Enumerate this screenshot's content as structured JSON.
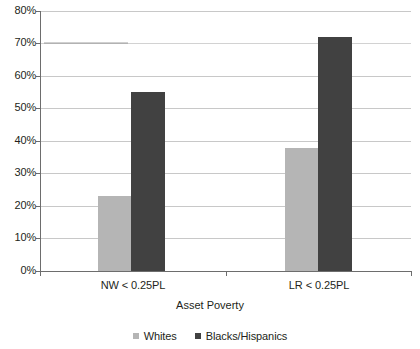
{
  "chart_data": {
    "type": "bar",
    "title": "",
    "xlabel": "Asset Poverty",
    "ylabel": "",
    "categories": [
      "NW < 0.25PL",
      "LR < 0.25PL"
    ],
    "series": [
      {
        "name": "Whites",
        "color": "#b5b5b5",
        "values": [
          23,
          38
        ]
      },
      {
        "name": "Blacks/Hispanics",
        "color": "#414141",
        "values": [
          55,
          72
        ]
      }
    ],
    "ylim": [
      0,
      80
    ],
    "y_tick_values": [
      0,
      10,
      20,
      30,
      40,
      50,
      60,
      70,
      80
    ],
    "y_tick_labels": [
      "0%",
      "10%",
      "20%",
      "30%",
      "40%",
      "50%",
      "60%",
      "70%",
      "80%"
    ],
    "grid": true,
    "legend_position": "bottom",
    "units": "percent"
  },
  "axis": {
    "x_title": "Asset Poverty",
    "y_labels": [
      "80%",
      "70%",
      "60%",
      "50%",
      "40%",
      "30%",
      "20%",
      "10%",
      "0%"
    ],
    "category_labels": [
      "NW < 0.25PL",
      "LR < 0.25PL"
    ]
  },
  "legend": {
    "items": [
      {
        "label": "Whites",
        "color": "#b5b5b5"
      },
      {
        "label": "Blacks/Hispanics",
        "color": "#414141"
      }
    ]
  }
}
